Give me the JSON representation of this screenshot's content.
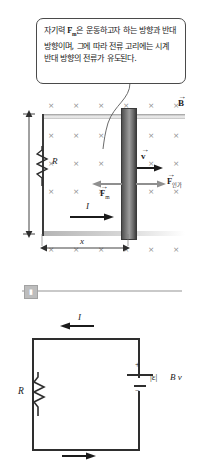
{
  "callout": {
    "name": "magnetic-force-explanation",
    "text_line1_pre": "자기력 ",
    "text_vector": "F",
    "text_vector_sub": "m",
    "text_rest": "은 운동하고자 하는 방향과 반대 방향이며, 그에 따라 전류 고리에는 시계 반대 방향의 전류가 유도된다."
  },
  "top_diagram": {
    "field_label": {
      "symbol": "B",
      "arrow": "→",
      "description": "magnetic-field-into-page"
    },
    "field_marker": "×",
    "field_rows": 5,
    "field_cols": 6,
    "resistor_label": "R",
    "velocity_label": {
      "symbol": "v",
      "arrow": "→"
    },
    "magnetic_force_label": {
      "symbol": "F",
      "arrow": "→",
      "sub": "m"
    },
    "applied_force_label": {
      "symbol": "F",
      "arrow": "→",
      "sub": "인가"
    },
    "current_label": "I",
    "width_label": "x",
    "height_label": ""
  },
  "divider": {
    "handle_glyph": "▮"
  },
  "bottom_circuit": {
    "current_label": "I",
    "resistor_label": "R",
    "emf_label": "|ε|",
    "emf_value": "B v",
    "plus_sign": "+",
    "minus_sign": "−"
  },
  "colors": {
    "ink": "#1b1b1b",
    "field_mark": "#8d8d8d",
    "wire": "#2e2e2e",
    "bar_dark": "#4f4f4f",
    "divider": "#c9c9c9"
  }
}
